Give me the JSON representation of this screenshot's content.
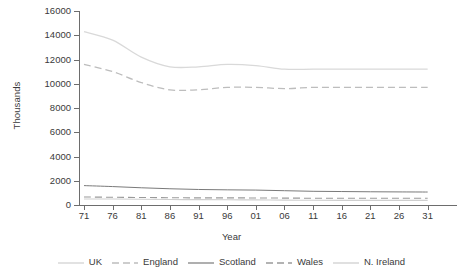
{
  "chart_data": {
    "type": "line",
    "title": "",
    "xlabel": "Year",
    "ylabel": "Thousands",
    "x": [
      71,
      76,
      81,
      86,
      91,
      96,
      1,
      6,
      11,
      16,
      21,
      26,
      31
    ],
    "xtick_labels": [
      "71",
      "76",
      "81",
      "86",
      "91",
      "96",
      "01",
      "06",
      "11",
      "16",
      "21",
      "26",
      "31"
    ],
    "ytick_labels": [
      "0",
      "2000",
      "4000",
      "6000",
      "8000",
      "10000",
      "12000",
      "14000",
      "16000"
    ],
    "ylim": [
      0,
      16000
    ],
    "xlim": [
      71,
      131
    ],
    "grid": false,
    "legend_position": "bottom",
    "series": [
      {
        "name": "UK",
        "style": "solid",
        "color": "#d9d9d9",
        "width": 1.3,
        "values": [
          14300,
          13600,
          12200,
          11400,
          11400,
          11600,
          11500,
          11200,
          11200,
          11200,
          11200,
          11200,
          11200
        ]
      },
      {
        "name": "England",
        "style": "dashed",
        "color": "#bdbdbd",
        "width": 1.3,
        "values": [
          11600,
          11000,
          10100,
          9500,
          9500,
          9700,
          9700,
          9600,
          9700,
          9700,
          9700,
          9700,
          9700
        ]
      },
      {
        "name": "Scotland",
        "style": "solid",
        "color": "#7a7a7a",
        "width": 1.0,
        "values": [
          1600,
          1520,
          1420,
          1340,
          1280,
          1250,
          1230,
          1180,
          1130,
          1110,
          1090,
          1080,
          1070
        ]
      },
      {
        "name": "Wales",
        "style": "dashed",
        "color": "#9a9a9a",
        "width": 1.1,
        "values": [
          660,
          640,
          620,
          600,
          590,
          590,
          580,
          570,
          560,
          560,
          560,
          560,
          560
        ]
      },
      {
        "name": "N. Ireland",
        "style": "solid",
        "color": "#cfcfcf",
        "width": 1.1,
        "values": [
          500,
          490,
          470,
          450,
          440,
          430,
          420,
          400,
          390,
          380,
          380,
          380,
          380
        ]
      }
    ]
  }
}
